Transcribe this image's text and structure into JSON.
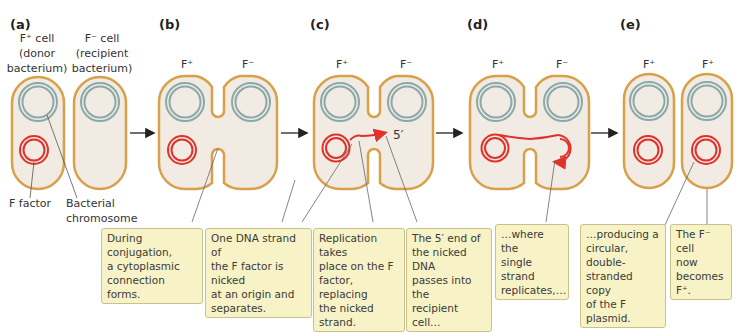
{
  "panels": [
    {
      "id": "a",
      "label": "(a)",
      "cells": [
        "F⁺ cell",
        "F⁻ cell"
      ]
    },
    {
      "id": "b",
      "label": "(b)",
      "cells": [
        "F⁺",
        "F⁻"
      ]
    },
    {
      "id": "c",
      "label": "(c)",
      "cells": [
        "F⁺",
        "F⁻"
      ]
    },
    {
      "id": "d",
      "label": "(d)",
      "cells": [
        "F⁺",
        "F⁻"
      ]
    },
    {
      "id": "e",
      "label": "(e)",
      "cells": [
        "F⁺",
        "F⁺"
      ]
    }
  ],
  "panel_a": {
    "donor_label_1": "F⁺ cell",
    "donor_label_2": "(donor",
    "donor_label_3": "bacterium)",
    "recipient_label_1": "F⁻ cell",
    "recipient_label_2": "(recipient",
    "recipient_label_3": "bacterium)",
    "f_factor": "F factor",
    "chromosome_1": "Bacterial",
    "chromosome_2": "chromosome"
  },
  "five_prime": "5′",
  "callouts": [
    {
      "lines": [
        "During conjugation,",
        "a cytoplasmic",
        "connection forms."
      ]
    },
    {
      "lines": [
        "One DNA strand of",
        "the F factor is nicked",
        "at an origin and",
        "separates."
      ]
    },
    {
      "lines": [
        "Replication takes",
        "place on the F",
        "factor, replacing",
        "the nicked strand."
      ]
    },
    {
      "lines": [
        "The 5′ end of",
        "the nicked DNA",
        "passes into the",
        "recipient cell…"
      ]
    },
    {
      "lines": [
        "…where the",
        "single strand",
        "replicates,…"
      ]
    },
    {
      "lines": [
        "…producing a",
        "circular, double-",
        "stranded copy",
        "of the F plasmid."
      ]
    },
    {
      "lines": [
        "The F⁻ cell",
        "now",
        "becomes F⁺."
      ]
    }
  ],
  "colors": {
    "membrane": "#d9a04a",
    "cytoplasm": "#f1ebe3",
    "chromosome": "#8aa9a8",
    "f_factor": "#e0322b",
    "callout_bg": "#f7f3c6",
    "callout_border": "#c9c28d"
  }
}
